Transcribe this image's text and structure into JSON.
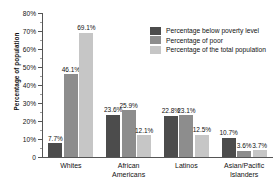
{
  "chart_data": {
    "type": "bar",
    "title": "",
    "xlabel": "",
    "ylabel": "Percentage of population",
    "ylim": [
      0,
      80
    ],
    "ytick_labels": [
      "0",
      "10%",
      "20%",
      "30%",
      "40%",
      "50%",
      "60%",
      "70%",
      "80%"
    ],
    "ytick_values": [
      0,
      10,
      20,
      30,
      40,
      50,
      60,
      70,
      80
    ],
    "grid": false,
    "legend_position": "upper right",
    "categories": [
      "Whites",
      "African\nAmericans",
      "Latinos",
      "Asian/Pacific\nIslanders"
    ],
    "series": [
      {
        "name": "Percentage below poverty level",
        "color": "#4c4c4c",
        "values": [
          7.7,
          23.6,
          22.8,
          10.7
        ],
        "labels": [
          "7.7%",
          "23.6%",
          "22.8%",
          "10.7%"
        ]
      },
      {
        "name": "Percentage of poor",
        "color": "#8d8d8d",
        "values": [
          46.1,
          25.9,
          23.1,
          3.6
        ],
        "labels": [
          "46.1%",
          "25.9%",
          "23.1%",
          "3.6%"
        ]
      },
      {
        "name": "Percentage of the total population",
        "color": "#c6c6c6",
        "values": [
          69.1,
          12.1,
          12.5,
          3.7
        ],
        "labels": [
          "69.1%",
          "12.1%",
          "12.5%",
          "3.7%"
        ]
      }
    ]
  }
}
